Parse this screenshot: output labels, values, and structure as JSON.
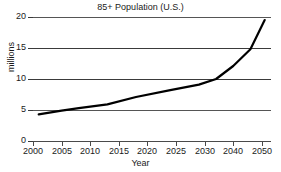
{
  "chart_data": {
    "type": "line",
    "title": "85+ Population (U.S.)",
    "xlabel": "Year",
    "ylabel": "millions",
    "xlim": [
      2000,
      2052
    ],
    "ylim": [
      0,
      20
    ],
    "grid": true,
    "legend": "none",
    "x_tick_labels": [
      "2000",
      "2005",
      "2010",
      "2015",
      "2020",
      "2025",
      "2030",
      "2040",
      "2050"
    ],
    "y_tick_labels": [
      "0",
      "5",
      "10",
      "15",
      "20"
    ],
    "y_ticks": [
      0,
      5,
      10,
      15,
      20
    ],
    "series": [
      {
        "name": "85+ Population",
        "color": "#000000",
        "x": [
          2001,
          2005,
          2008,
          2013,
          2018,
          2024,
          2029,
          2034,
          2040,
          2046,
          2051
        ],
        "values": [
          4.3,
          4.9,
          5.3,
          5.9,
          7.1,
          8.2,
          9.1,
          10.0,
          12.1,
          14.8,
          19.5
        ]
      }
    ]
  },
  "chart": {
    "title": "85+ Population (U.S.)",
    "x_axis_title": "Year",
    "y_axis_title": "millions"
  }
}
